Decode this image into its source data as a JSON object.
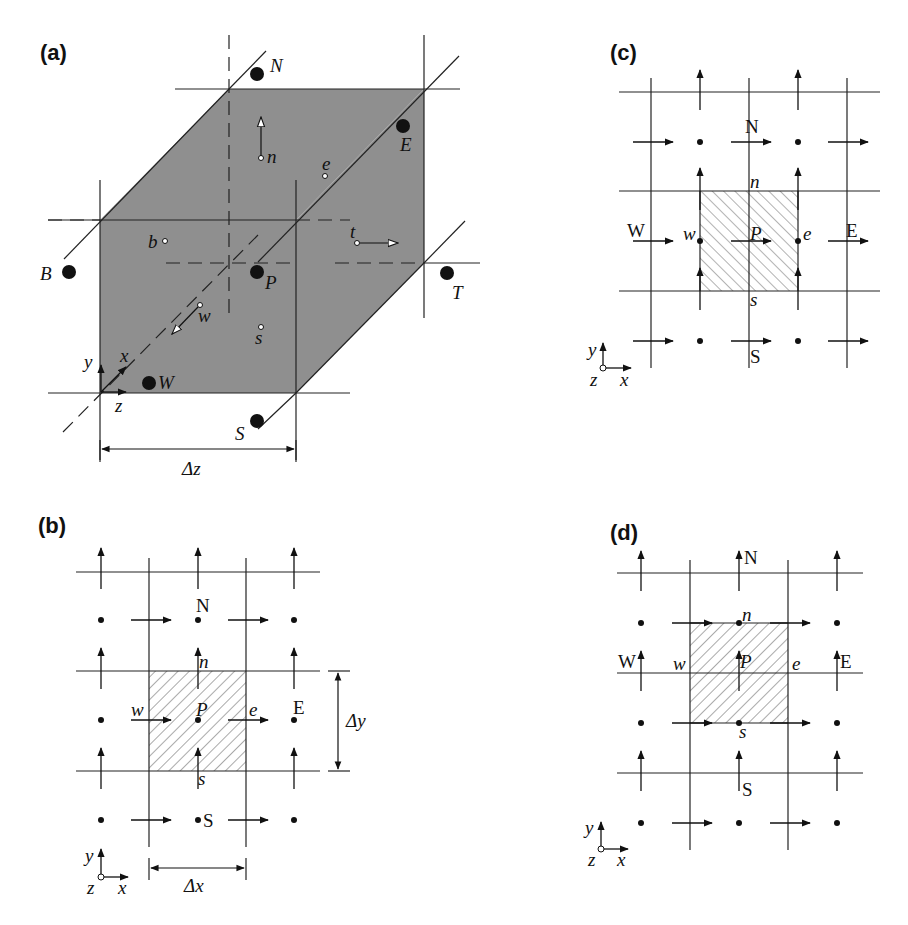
{
  "figure": {
    "panels": [
      {
        "id": "a",
        "label": "(a)",
        "type": "3d-control-volume",
        "nodes": {
          "N": "N",
          "E": "E",
          "B": "B",
          "P": "P",
          "T": "T",
          "W": "W",
          "S": "S"
        },
        "faces": {
          "n": "n",
          "e": "e",
          "b": "b",
          "t": "t",
          "w": "w",
          "s": "s"
        },
        "axes": {
          "x": "x",
          "y": "y",
          "z": "z"
        },
        "dimension": "Δz"
      },
      {
        "id": "b",
        "label": "(b)",
        "type": "2d-staggered-grid",
        "nodes": {
          "N": "N",
          "P": "P",
          "E": "E",
          "S": "S"
        },
        "faces": {
          "n": "n",
          "w": "w",
          "e": "e",
          "s": "s"
        },
        "axes": {
          "x": "x",
          "y": "y",
          "z": "z"
        },
        "dimension_x": "Δx",
        "dimension_y": "Δy"
      },
      {
        "id": "c",
        "label": "(c)",
        "type": "2d-staggered-grid-u-cell",
        "nodes": {
          "N": "N",
          "W": "W",
          "P": "P",
          "E": "E",
          "S": "S"
        },
        "faces": {
          "n": "n",
          "w": "w",
          "e": "e",
          "s": "s"
        },
        "axes": {
          "x": "x",
          "y": "y",
          "z": "z"
        }
      },
      {
        "id": "d",
        "label": "(d)",
        "type": "2d-staggered-grid-v-cell",
        "nodes": {
          "N": "N",
          "W": "W",
          "P": "P",
          "E": "E",
          "S": "S"
        },
        "faces": {
          "n": "n",
          "w": "w",
          "e": "e",
          "s": "s"
        },
        "axes": {
          "x": "x",
          "y": "y",
          "z": "z"
        }
      }
    ],
    "colors": {
      "cube_fill": "#8f8f8f",
      "line": "#222222",
      "hatch": "#555555",
      "background": "#ffffff"
    }
  }
}
